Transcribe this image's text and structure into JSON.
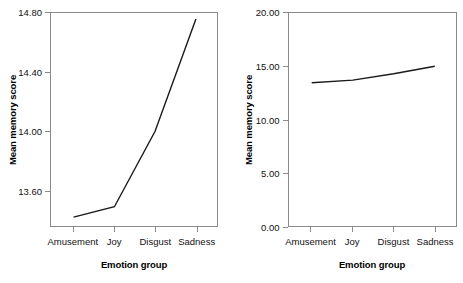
{
  "chart_data": [
    {
      "panel": "left",
      "type": "line",
      "title": "",
      "xlabel": "Emotion group",
      "ylabel": "Mean memory score",
      "categories": [
        "Amusement",
        "Joy",
        "Disgust",
        "Sadness"
      ],
      "values": [
        13.42,
        13.49,
        14.0,
        14.76
      ],
      "yticks": [
        "13.60",
        "14.00",
        "14.40",
        "14.80"
      ],
      "ytick_values": [
        13.6,
        14.0,
        14.4,
        14.8
      ],
      "ylim": [
        13.36,
        14.8
      ],
      "grid": false,
      "legend": "none",
      "line_color": "#1a1a1a",
      "axis_color": "#8a8a8a"
    },
    {
      "panel": "right",
      "type": "line",
      "title": "",
      "xlabel": "Emotion group",
      "ylabel": "Mean memory score",
      "categories": [
        "Amusement",
        "Joy",
        "Disgust",
        "Sadness"
      ],
      "values": [
        13.45,
        13.7,
        14.3,
        15.0
      ],
      "yticks": [
        "0.00",
        "5.00",
        "10.00",
        "15.00",
        "20.00"
      ],
      "ytick_values": [
        0,
        5,
        10,
        15,
        20
      ],
      "ylim": [
        0,
        20
      ],
      "grid": false,
      "legend": "none",
      "line_color": "#1a1a1a",
      "axis_color": "#8a8a8a"
    }
  ]
}
